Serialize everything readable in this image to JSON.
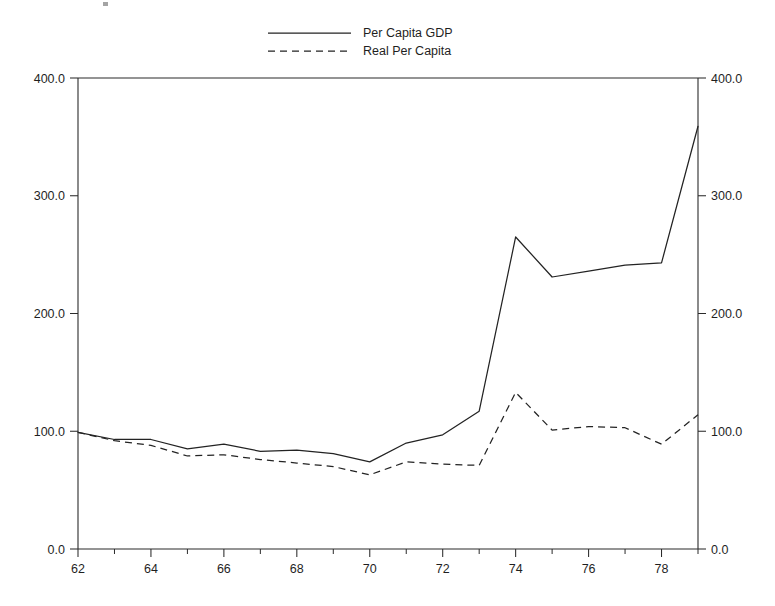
{
  "chart_data": {
    "type": "line",
    "title": "",
    "subtitle": "",
    "xlabel": "",
    "ylabel": "",
    "xlim": [
      62,
      79
    ],
    "ylim": [
      0,
      400
    ],
    "grid": false,
    "legend_position": "top-center",
    "x": [
      62,
      63,
      64,
      65,
      66,
      67,
      68,
      69,
      70,
      71,
      72,
      73,
      74,
      75,
      76,
      77,
      78,
      79
    ],
    "x_tick_labels": [
      "62",
      "64",
      "66",
      "68",
      "70",
      "72",
      "74",
      "76",
      "78"
    ],
    "x_tick_values": [
      62,
      64,
      66,
      68,
      70,
      72,
      74,
      76,
      78
    ],
    "x_minor_ticks": [
      63,
      65,
      67,
      69,
      71,
      73,
      75,
      77,
      79
    ],
    "y_tick_labels": [
      "0.0",
      "100.0",
      "200.0",
      "300.0",
      "400.0"
    ],
    "y_tick_values": [
      0,
      100,
      200,
      300,
      400
    ],
    "right_axis_tick_labels": [
      "0.0",
      "100.0",
      "200.0",
      "300.0",
      "400.0"
    ],
    "series": [
      {
        "name": "Per Capita GDP",
        "style": "solid",
        "color": "#232323",
        "values": [
          99,
          93,
          93,
          85,
          89,
          83,
          84,
          81,
          74,
          90,
          97,
          117,
          265,
          231,
          236,
          241,
          243,
          359
        ]
      },
      {
        "name": "Real Per Capita",
        "style": "dashed",
        "color": "#232323",
        "values": [
          99,
          92,
          88,
          79,
          80,
          76,
          73,
          70,
          63,
          74,
          72,
          71,
          133,
          101,
          104,
          103,
          89,
          114
        ]
      }
    ]
  },
  "legend": {
    "entries": [
      {
        "label": "Per Capita GDP",
        "style": "solid"
      },
      {
        "label": "Real Per Capita",
        "style": "dashed"
      }
    ]
  },
  "axes": {
    "left_title": "",
    "right_title": ""
  }
}
